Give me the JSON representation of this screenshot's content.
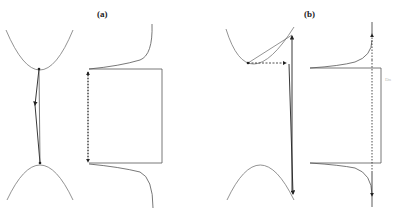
{
  "panels": [
    {
      "label": "(a)",
      "x": 97,
      "y": 9
    },
    {
      "label": "(b)",
      "x": 304,
      "y": 9
    }
  ],
  "faint_text": {
    "text": "Dn",
    "x": 385,
    "y": 77
  },
  "colors": {
    "stroke": "#333333",
    "curve": "#777777"
  }
}
